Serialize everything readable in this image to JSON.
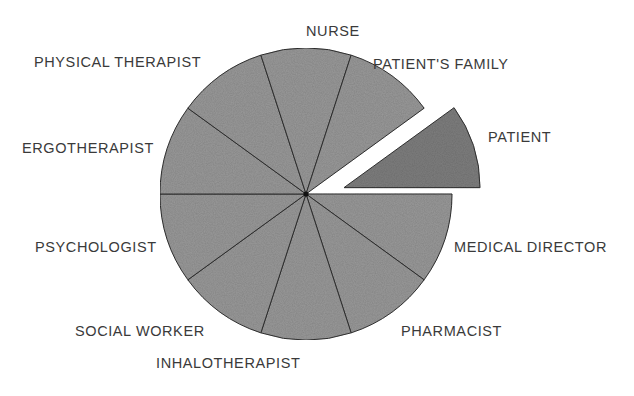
{
  "chart_data": {
    "type": "pie",
    "title": "",
    "exploded": [
      "PATIENT"
    ],
    "categories": [
      "MEDICAL DIRECTOR",
      "PHARMACIST",
      "INHALOTHERAPIST",
      "SOCIAL WORKER",
      "PSYCHOLOGIST",
      "ERGOTHERAPIST",
      "PHYSICAL THERAPIST",
      "NURSE",
      "PATIENT'S FAMILY",
      "PATIENT"
    ],
    "values": [
      10,
      10,
      10,
      10,
      10,
      10,
      10,
      10,
      10,
      10
    ],
    "legend": "none (labels placed outside slices)",
    "fill": "#9a9a9a",
    "exploded_fill": "#7f7f7f",
    "stroke": "#333333"
  },
  "labels": {
    "nurse": "NURSE",
    "patients_family": "PATIENT'S FAMILY",
    "physical_therapist": "PHYSICAL THERAPIST",
    "patient": "PATIENT",
    "ergotherapist": "ERGOTHERAPIST",
    "psychologist": "PSYCHOLOGIST",
    "medical_director": "MEDICAL DIRECTOR",
    "social_worker": "SOCIAL WORKER",
    "pharmacist": "PHARMACIST",
    "inhalotherapist": "INHALOTHERAPIST"
  }
}
